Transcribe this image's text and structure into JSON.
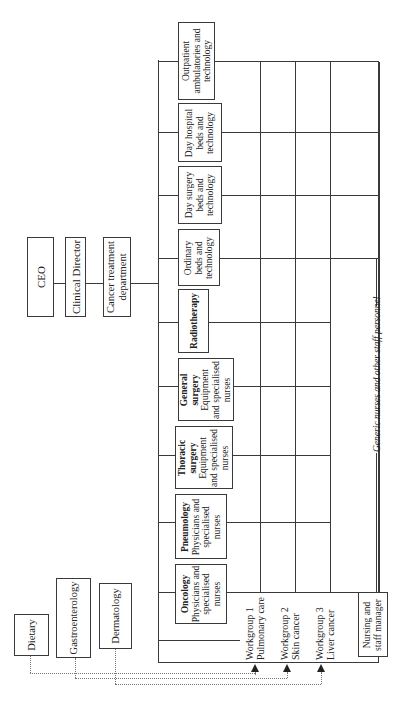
{
  "hierarchy": {
    "ceo": "CEO",
    "clinical_director": "Clinical Director",
    "department": [
      "Cancer treatment",
      "department"
    ]
  },
  "units": [
    {
      "title": "Outpatient",
      "lines": [
        "ambulatories and",
        "technology"
      ],
      "bold": false
    },
    {
      "title": "Day hospital",
      "lines": [
        "beds and",
        "technology"
      ],
      "bold": false
    },
    {
      "title": "Day surgery",
      "lines": [
        "beds and",
        "technology"
      ],
      "bold": false
    },
    {
      "title": "Ordinary",
      "lines": [
        "beds and",
        "technology"
      ],
      "bold": false
    },
    {
      "title": "Radiotherapy",
      "lines": [],
      "bold": true
    },
    {
      "title": "General",
      "title2": "surgery",
      "lines": [
        "Equipment",
        "and specialised",
        "nurses"
      ],
      "bold": true
    },
    {
      "title": "Thoracic",
      "title2": "surgery",
      "lines": [
        "Equipment",
        "and specialised",
        "nurses"
      ],
      "bold": true
    },
    {
      "title": "Pneumology",
      "lines": [
        "Physicians and",
        "specialised",
        "nurses"
      ],
      "bold": true
    },
    {
      "title": "Oncology",
      "lines": [
        "Physicians and",
        "specialised",
        "nurses"
      ],
      "bold": true
    }
  ],
  "workgroups": [
    {
      "line1": "Workgroup 1",
      "line2": "Pulmonary care"
    },
    {
      "line1": "Workgroup 2",
      "line2": "Skin cancer"
    },
    {
      "line1": "Workgroup 3",
      "line2": "Liver cancer"
    }
  ],
  "external_units": [
    "Dietary",
    "Gastroenterology",
    "Dermatology"
  ],
  "nursing_manager": [
    "Nursing and",
    "staff manager"
  ],
  "generic_staff_label": "Generic nurses and other staff personnel"
}
